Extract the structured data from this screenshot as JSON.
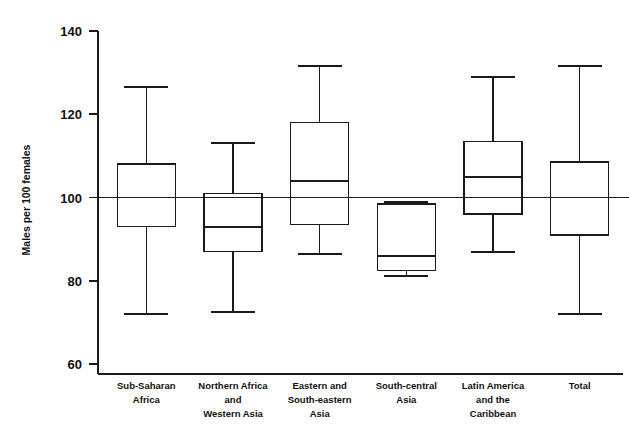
{
  "chart_data": {
    "type": "box",
    "title": "",
    "subtitle": "",
    "xlabel": "",
    "ylabel": "Males per 100 females",
    "ylim": [
      55,
      142
    ],
    "yticks": [
      60,
      80,
      100,
      120,
      140
    ],
    "ytick_labels": [
      "60",
      "80",
      "100",
      "120",
      "140"
    ],
    "grid": false,
    "legend": "none",
    "reference_line": {
      "value": 100,
      "orientation": "horizontal",
      "label": ""
    },
    "categories": [
      "Sub-Saharan Africa",
      "Northern Africa and Western Asia",
      "Eastern and South-eastern Asia",
      "South-central Asia",
      "Latin America and the Caribbean",
      "Total"
    ],
    "category_label_lines": [
      [
        "Sub-Saharan",
        "Africa"
      ],
      [
        "Northern Africa",
        "and",
        "Western Asia"
      ],
      [
        "Eastern and",
        "South-eastern",
        "Asia"
      ],
      [
        "South-central",
        "Asia"
      ],
      [
        "Latin America",
        "and the",
        "Caribbean"
      ],
      [
        "Total"
      ]
    ],
    "boxes": [
      {
        "name": "Sub-Saharan Africa",
        "whisker_low": 72.0,
        "q1": 93.0,
        "median": 100.0,
        "q3": 108.0,
        "whisker_high": 126.5
      },
      {
        "name": "Northern Africa and Western Asia",
        "whisker_low": 72.5,
        "q1": 87.0,
        "median": 93.0,
        "q3": 101.0,
        "whisker_high": 113.0
      },
      {
        "name": "Eastern and South-eastern Asia",
        "whisker_low": 86.5,
        "q1": 93.5,
        "median": 104.0,
        "q3": 118.0,
        "whisker_high": 131.5
      },
      {
        "name": "South-central Asia",
        "whisker_low": 81.2,
        "q1": 82.5,
        "median": 86.0,
        "q3": 98.5,
        "whisker_high": 99.0
      },
      {
        "name": "Latin America and the Caribbean",
        "whisker_low": 87.0,
        "q1": 96.0,
        "median": 105.0,
        "q3": 113.5,
        "whisker_high": 129.0
      },
      {
        "name": "Total",
        "whisker_low": 72.0,
        "q1": 91.0,
        "median": 100.0,
        "q3": 108.5,
        "whisker_high": 131.5
      }
    ],
    "colors": {
      "line": "#1a1a1a",
      "background": "#ffffff",
      "box_fill": "none"
    }
  }
}
